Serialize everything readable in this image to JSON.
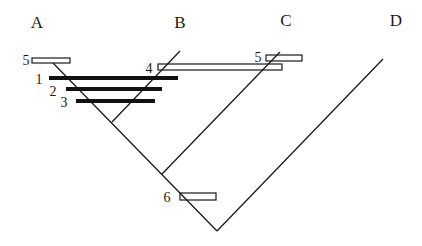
{
  "diagram": {
    "type": "cladogram",
    "taxa": [
      {
        "id": "A",
        "label": "A",
        "x": 37,
        "y": 28
      },
      {
        "id": "B",
        "label": "B",
        "x": 180,
        "y": 28
      },
      {
        "id": "C",
        "label": "C",
        "x": 286,
        "y": 26
      },
      {
        "id": "D",
        "label": "D",
        "x": 396,
        "y": 26
      }
    ],
    "character_markers": [
      {
        "id": "m5a",
        "label": "5",
        "kind": "open",
        "label_x": 26,
        "label_y": 65
      },
      {
        "id": "m1",
        "label": "1",
        "kind": "solid",
        "label_x": 37,
        "label_y": 84
      },
      {
        "id": "m2",
        "label": "2",
        "kind": "solid",
        "label_x": 53,
        "label_y": 95
      },
      {
        "id": "m3",
        "label": "3",
        "kind": "solid",
        "label_x": 63,
        "label_y": 107
      },
      {
        "id": "m4",
        "label": "4",
        "kind": "open",
        "label_x": 149,
        "label_y": 73
      },
      {
        "id": "m5c",
        "label": "5",
        "kind": "open",
        "label_x": 258,
        "label_y": 62
      },
      {
        "id": "m6",
        "label": "6",
        "kind": "open",
        "label_x": 167,
        "label_y": 202
      }
    ],
    "line_color": "#1a1a1a",
    "background": "#ffffff"
  }
}
